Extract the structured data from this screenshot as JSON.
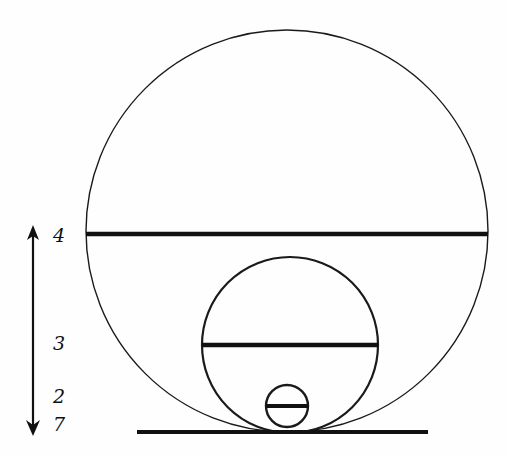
{
  "figure": {
    "background_color": "#fefefe",
    "ink_color": "#111111",
    "thin_stroke_color": "#1a1a1a",
    "baseline": {
      "name": "ground-line",
      "x1": 137,
      "x2": 428,
      "y": 432,
      "thickness": 4
    },
    "circles": [
      {
        "name": "large-circle",
        "cx": 287,
        "cy": 231,
        "r": 201,
        "stroke_width": 1.4,
        "chord": {
          "name": "large-circle-chord",
          "y": 234,
          "x1": 86,
          "x2": 488,
          "thickness": 4.5
        }
      },
      {
        "name": "medium-circle",
        "cx": 290,
        "cy": 345,
        "r": 88,
        "stroke_width": 2.2,
        "chord": {
          "name": "medium-circle-chord",
          "y": 345,
          "x1": 202,
          "x2": 378,
          "thickness": 4.5
        }
      },
      {
        "name": "small-circle",
        "cx": 287,
        "cy": 406,
        "r": 21,
        "stroke_width": 2.4,
        "chord": {
          "name": "small-circle-chord",
          "y": 406,
          "x1": 266,
          "x2": 308,
          "thickness": 4
        }
      }
    ],
    "arrow": {
      "name": "vertical-measure-arrow",
      "x": 33,
      "y_top": 231,
      "y_bottom": 430,
      "thickness": 2.2,
      "double_headed": true
    },
    "labels": [
      {
        "name": "scale-label-4",
        "text": "4",
        "x": 53,
        "y": 242
      },
      {
        "name": "scale-label-3",
        "text": "3",
        "x": 53,
        "y": 350
      },
      {
        "name": "scale-label-2",
        "text": "2",
        "x": 53,
        "y": 403
      },
      {
        "name": "scale-label-7",
        "text": "7",
        "x": 53,
        "y": 431
      }
    ]
  }
}
